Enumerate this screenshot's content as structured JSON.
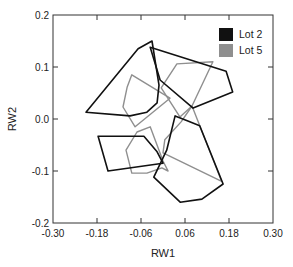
{
  "chart_data": {
    "type": "scatter",
    "subtype": "convex-hull polygons",
    "title": "",
    "xlabel": "RW1",
    "ylabel": "RW2",
    "xlim": [
      -0.3,
      0.3
    ],
    "ylim": [
      -0.2,
      0.2
    ],
    "xticks": [
      -0.3,
      -0.18,
      -0.06,
      0.06,
      0.18,
      0.3
    ],
    "xtick_labels": [
      "-0.30",
      "-0.18",
      "-0.06",
      "0.06",
      "0.18",
      "0.30"
    ],
    "yticks": [
      -0.2,
      -0.1,
      0.0,
      0.1,
      0.2
    ],
    "ytick_labels": [
      "-0.2",
      "-0.1",
      "0.0",
      "0.1",
      "0.2"
    ],
    "grid": false,
    "legend": {
      "placement": "top-right",
      "entries": [
        {
          "label": "Lot 2",
          "color": "#111111"
        },
        {
          "label": "Lot 5",
          "color": "#8f8f8f"
        }
      ]
    },
    "series": [
      {
        "name": "Lot 2",
        "color": "#111111",
        "polygons": [
          [
            [
              -0.21,
              0.013
            ],
            [
              -0.068,
              0.135
            ],
            [
              -0.03,
              0.15
            ],
            [
              -0.011,
              0.065
            ],
            [
              -0.016,
              0.031
            ],
            [
              -0.044,
              0.013
            ],
            [
              -0.09,
              0.006
            ]
          ],
          [
            [
              -0.035,
              0.138
            ],
            [
              0.172,
              0.092
            ],
            [
              0.19,
              0.052
            ],
            [
              0.082,
              0.021
            ],
            [
              -0.008,
              0.075
            ]
          ],
          [
            [
              -0.177,
              -0.033
            ],
            [
              -0.052,
              -0.033
            ],
            [
              -0.016,
              -0.063
            ],
            [
              0.0,
              -0.085
            ],
            [
              -0.15,
              -0.1
            ]
          ],
          [
            [
              0.033,
              0.006
            ],
            [
              0.068,
              -0.004
            ],
            [
              0.1,
              -0.013
            ],
            [
              0.164,
              -0.125
            ],
            [
              0.106,
              -0.154
            ],
            [
              0.047,
              -0.16
            ],
            [
              -0.025,
              -0.112
            ],
            [
              0.01,
              -0.06
            ]
          ]
        ]
      },
      {
        "name": "Lot 5",
        "color": "#8f8f8f",
        "polygons": [
          [
            [
              -0.085,
              0.085
            ],
            [
              0.019,
              0.04
            ],
            [
              -0.076,
              -0.015
            ],
            [
              -0.109,
              0.023
            ],
            [
              -0.098,
              0.061
            ]
          ],
          [
            [
              0.038,
              0.106
            ],
            [
              0.136,
              0.11
            ],
            [
              0.079,
              0.025
            ],
            [
              0.046,
              0.004
            ],
            [
              -0.005,
              0.06
            ]
          ],
          [
            [
              -0.035,
              -0.015
            ],
            [
              0.0,
              -0.081
            ],
            [
              0.014,
              -0.1
            ],
            [
              -0.003,
              -0.094
            ],
            [
              -0.044,
              -0.104
            ],
            [
              -0.085,
              -0.104
            ],
            [
              -0.101,
              -0.06
            ],
            [
              -0.071,
              -0.025
            ]
          ],
          [
            [
              0.079,
              0.025
            ],
            [
              0.16,
              -0.12
            ],
            [
              0.0,
              -0.065
            ],
            [
              0.005,
              -0.04
            ],
            [
              0.05,
              -0.005
            ]
          ]
        ]
      }
    ]
  }
}
